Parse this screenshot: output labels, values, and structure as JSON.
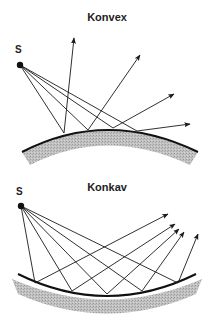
{
  "diagrams": [
    {
      "title": "Konvex",
      "source_label": "S"
    },
    {
      "title": "Konkav",
      "source_label": "S"
    }
  ],
  "colors": {
    "line": "#1a1a1a",
    "mirror_fill": "#b9b9b9",
    "mirror_edge": "#111111",
    "background": "#ffffff"
  }
}
